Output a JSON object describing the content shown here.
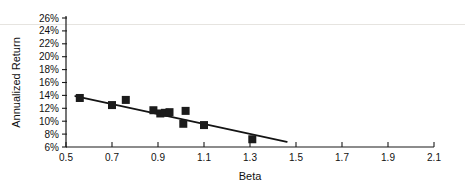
{
  "chart_data": {
    "type": "scatter",
    "title": "",
    "xlabel": "Beta",
    "ylabel": "Annualized Return",
    "xlim": [
      0.5,
      2.1
    ],
    "ylim": [
      6,
      26
    ],
    "grid": false,
    "legend": "none",
    "x_ticks": [
      "0.5",
      "0.7",
      "0.9",
      "1.1",
      "1.3",
      "1.5",
      "1.7",
      "1.9",
      "2.1"
    ],
    "x_tick_values": [
      0.5,
      0.7,
      0.9,
      1.1,
      1.3,
      1.5,
      1.7,
      1.9,
      2.1
    ],
    "y_ticks": [
      "6%",
      "8%",
      "10%",
      "12%",
      "14%",
      "16%",
      "18%",
      "20%",
      "22%",
      "24%",
      "26%"
    ],
    "y_tick_values": [
      6,
      8,
      10,
      12,
      14,
      16,
      18,
      20,
      22,
      24,
      26
    ],
    "points": [
      {
        "x": 0.56,
        "y": 13.6
      },
      {
        "x": 0.7,
        "y": 12.5
      },
      {
        "x": 0.76,
        "y": 13.3
      },
      {
        "x": 0.88,
        "y": 11.7
      },
      {
        "x": 0.91,
        "y": 11.2
      },
      {
        "x": 0.93,
        "y": 11.3
      },
      {
        "x": 0.95,
        "y": 11.4
      },
      {
        "x": 1.01,
        "y": 9.6
      },
      {
        "x": 1.02,
        "y": 11.6
      },
      {
        "x": 1.1,
        "y": 9.4
      },
      {
        "x": 1.31,
        "y": 7.2
      }
    ],
    "trendline": {
      "x_start": 0.54,
      "y_start": 13.9,
      "x_end": 1.46,
      "y_end": 6.8
    },
    "marker_style": "filled-square",
    "marker_color": "#1b1b1b",
    "line_color": "#141414",
    "background_color": "#ffffff",
    "axis_color": "#1a1a1a"
  }
}
